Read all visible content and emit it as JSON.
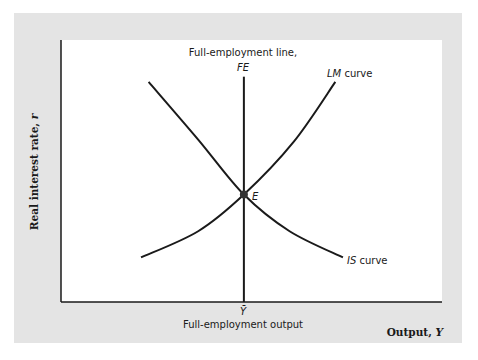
{
  "chart_data": {
    "type": "line",
    "title": "",
    "xlabel": "Output, Y",
    "ylabel": "Real interest rate, r",
    "grid": false,
    "axes": {
      "x_ticks": [
        {
          "label": "Ȳ",
          "caption": "Full-employment output",
          "x": 0.48
        }
      ]
    },
    "series": [
      {
        "name": "IS curve",
        "label_italic": "IS",
        "label_rest": " curve",
        "shape": "downward-sloping convex",
        "points": [
          [
            0.23,
            0.84
          ],
          [
            0.36,
            0.62
          ],
          [
            0.48,
            0.41
          ],
          [
            0.6,
            0.27
          ],
          [
            0.74,
            0.17
          ]
        ]
      },
      {
        "name": "LM curve",
        "label_italic": "LM",
        "label_rest": " curve",
        "shape": "upward-sloping convex",
        "points": [
          [
            0.21,
            0.17
          ],
          [
            0.36,
            0.27
          ],
          [
            0.48,
            0.41
          ],
          [
            0.61,
            0.61
          ],
          [
            0.72,
            0.84
          ]
        ]
      },
      {
        "name": "Full-employment line, FE",
        "label_line1": "Full-employment line,",
        "label_line2": "FE",
        "shape": "vertical",
        "x": 0.48,
        "y_range": [
          0,
          0.86
        ]
      }
    ],
    "points": [
      {
        "name": "E",
        "label": "E",
        "x": 0.48,
        "y": 0.41,
        "description": "General equilibrium"
      }
    ],
    "xlim": [
      0,
      1
    ],
    "ylim": [
      0,
      1
    ]
  },
  "labels": {
    "ylabel_text": "Real interest rate, ",
    "ylabel_var": "r",
    "xlabel_text": "Output, ",
    "xlabel_var": "Y",
    "ybar": "Ȳ",
    "full_employment_output": "Full-employment output",
    "fe_line1": "Full-employment line,",
    "fe_line2": "FE",
    "lm_italic": "LM",
    "lm_rest": " curve",
    "is_italic": "IS",
    "is_rest": " curve",
    "point_e": "E"
  },
  "colors": {
    "panel": "#e4e4e4",
    "plot": "#ffffff",
    "ink": "#1a1a1a"
  }
}
